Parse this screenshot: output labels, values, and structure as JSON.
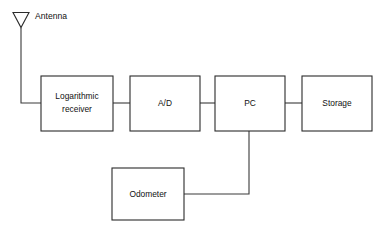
{
  "diagram": {
    "background_color": "#ffffff",
    "stroke_color": "#2b2b2b",
    "text_color": "#111111",
    "antenna": {
      "icon": "antenna-triangle-icon",
      "label": "Antenna"
    },
    "blocks": [
      {
        "id": "logarithmic-receiver",
        "label_lines": [
          "Logarithmic",
          "receiver"
        ],
        "label": "Logarithmic receiver"
      },
      {
        "id": "ad-converter",
        "label_lines": [
          "A/D"
        ],
        "label": "A/D"
      },
      {
        "id": "pc",
        "label_lines": [
          "PC"
        ],
        "label": "PC"
      },
      {
        "id": "storage",
        "label_lines": [
          "Storage"
        ],
        "label": "Storage"
      },
      {
        "id": "odometer",
        "label_lines": [
          "Odometer"
        ],
        "label": "Odometer"
      }
    ],
    "connections": [
      {
        "from": "antenna",
        "to": "logarithmic-receiver"
      },
      {
        "from": "logarithmic-receiver",
        "to": "ad-converter"
      },
      {
        "from": "ad-converter",
        "to": "pc"
      },
      {
        "from": "pc",
        "to": "storage"
      },
      {
        "from": "odometer",
        "to": "pc"
      }
    ]
  }
}
